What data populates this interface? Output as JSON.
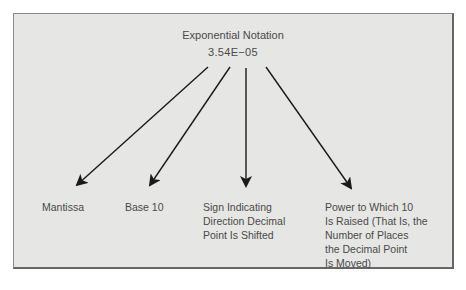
{
  "diagram": {
    "title": "Exponential Notation",
    "value": "3.54E−05",
    "parts": [
      {
        "id": "mantissa",
        "label": "Mantissa"
      },
      {
        "id": "base",
        "label": "Base 10"
      },
      {
        "id": "sign",
        "label": "Sign Indicating\nDirection Decimal\nPoint Is Shifted"
      },
      {
        "id": "power",
        "label": "Power to Which 10\nIs Raised (That Is, the\nNumber of Places\nthe Decimal Point\nIs Moved)"
      }
    ],
    "colors": {
      "panel_bg": "#e6e6e4",
      "border": "#777777",
      "text": "#4a4a4a",
      "arrow": "#1a1a1a"
    }
  }
}
